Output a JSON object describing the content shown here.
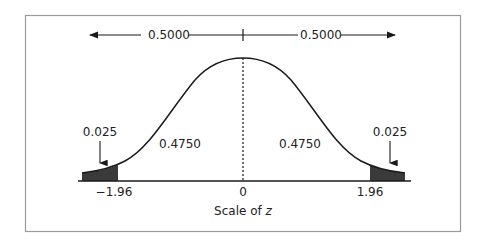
{
  "diagram": {
    "type": "normal-distribution",
    "top_arrow": {
      "left_label": "0.5000",
      "right_label": "0.5000"
    },
    "regions": {
      "left_tail": {
        "label": "0.025",
        "cut": "-1.96"
      },
      "left_center": {
        "label": "0.4750"
      },
      "right_center": {
        "label": "0.4750"
      },
      "right_tail": {
        "label": "0.025",
        "cut": "1.96"
      }
    },
    "axis": {
      "center_tick": "0",
      "left_tick": "−1.96",
      "right_tick": "1.96",
      "title_prefix": "Scale of ",
      "title_var": "z"
    },
    "colors": {
      "line": "#1a1a1a",
      "tail_fill": "#3a3a3a",
      "frame": "#9a9a9a"
    }
  }
}
